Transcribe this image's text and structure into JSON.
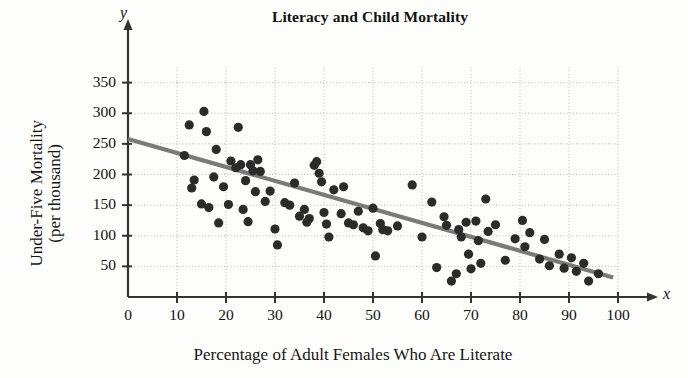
{
  "chart_data": {
    "type": "scatter",
    "title": "Literacy and Child Mortality",
    "xlabel": "Percentage of Adult Females Who Are Literate",
    "ylabel_line1": "Under-Five Mortality",
    "ylabel_line2": "(per thousand)",
    "x_axis_variable": "x",
    "y_axis_variable": "y",
    "xlim": [
      0,
      103
    ],
    "ylim": [
      0,
      375
    ],
    "xticks": [
      0,
      10,
      20,
      30,
      40,
      50,
      60,
      70,
      80,
      90,
      100
    ],
    "yticks": [
      50,
      100,
      150,
      200,
      250,
      300,
      350
    ],
    "grid": true,
    "grid_style": "dotted",
    "marker_color": "#2b2b2b",
    "trendline_color": "#7a7a7a",
    "axis_color": "#333333",
    "trendline": {
      "x_start": 0,
      "y_start": 258,
      "x_end": 99,
      "y_end": 32
    },
    "points": [
      {
        "x": 11.5,
        "y": 231
      },
      {
        "x": 12.5,
        "y": 281
      },
      {
        "x": 13.0,
        "y": 178
      },
      {
        "x": 13.5,
        "y": 191
      },
      {
        "x": 15.0,
        "y": 152
      },
      {
        "x": 15.5,
        "y": 303
      },
      {
        "x": 16.0,
        "y": 270
      },
      {
        "x": 16.5,
        "y": 146
      },
      {
        "x": 17.5,
        "y": 196
      },
      {
        "x": 18.0,
        "y": 241
      },
      {
        "x": 18.5,
        "y": 121
      },
      {
        "x": 19.5,
        "y": 180
      },
      {
        "x": 20.5,
        "y": 151
      },
      {
        "x": 21.0,
        "y": 222
      },
      {
        "x": 22.0,
        "y": 211
      },
      {
        "x": 22.5,
        "y": 277
      },
      {
        "x": 23.0,
        "y": 216
      },
      {
        "x": 23.5,
        "y": 143
      },
      {
        "x": 24.0,
        "y": 190
      },
      {
        "x": 24.5,
        "y": 123
      },
      {
        "x": 25.0,
        "y": 216
      },
      {
        "x": 25.5,
        "y": 206
      },
      {
        "x": 26.0,
        "y": 172
      },
      {
        "x": 26.5,
        "y": 224
      },
      {
        "x": 27.0,
        "y": 205
      },
      {
        "x": 28.0,
        "y": 156
      },
      {
        "x": 29.0,
        "y": 173
      },
      {
        "x": 30.0,
        "y": 111
      },
      {
        "x": 30.5,
        "y": 85
      },
      {
        "x": 32.0,
        "y": 154
      },
      {
        "x": 33.0,
        "y": 150
      },
      {
        "x": 34.0,
        "y": 186
      },
      {
        "x": 35.0,
        "y": 132
      },
      {
        "x": 36.0,
        "y": 143
      },
      {
        "x": 36.5,
        "y": 122
      },
      {
        "x": 37.0,
        "y": 128
      },
      {
        "x": 38.0,
        "y": 215
      },
      {
        "x": 38.5,
        "y": 221
      },
      {
        "x": 39.0,
        "y": 202
      },
      {
        "x": 39.5,
        "y": 188
      },
      {
        "x": 40.0,
        "y": 138
      },
      {
        "x": 40.5,
        "y": 119
      },
      {
        "x": 41.0,
        "y": 98
      },
      {
        "x": 42.0,
        "y": 175
      },
      {
        "x": 43.5,
        "y": 136
      },
      {
        "x": 44.0,
        "y": 180
      },
      {
        "x": 45.0,
        "y": 121
      },
      {
        "x": 46.0,
        "y": 118
      },
      {
        "x": 47.0,
        "y": 140
      },
      {
        "x": 48.0,
        "y": 113
      },
      {
        "x": 49.0,
        "y": 108
      },
      {
        "x": 50.0,
        "y": 145
      },
      {
        "x": 50.5,
        "y": 67
      },
      {
        "x": 51.5,
        "y": 120
      },
      {
        "x": 52.0,
        "y": 110
      },
      {
        "x": 53.0,
        "y": 108
      },
      {
        "x": 55.0,
        "y": 116
      },
      {
        "x": 58.0,
        "y": 183
      },
      {
        "x": 60.0,
        "y": 98
      },
      {
        "x": 62.0,
        "y": 155
      },
      {
        "x": 63.0,
        "y": 48
      },
      {
        "x": 64.5,
        "y": 131
      },
      {
        "x": 65.0,
        "y": 117
      },
      {
        "x": 66.0,
        "y": 26
      },
      {
        "x": 67.0,
        "y": 38
      },
      {
        "x": 67.5,
        "y": 110
      },
      {
        "x": 68.0,
        "y": 98
      },
      {
        "x": 69.0,
        "y": 122
      },
      {
        "x": 69.5,
        "y": 70
      },
      {
        "x": 70.0,
        "y": 46
      },
      {
        "x": 71.0,
        "y": 124
      },
      {
        "x": 71.5,
        "y": 92
      },
      {
        "x": 72.0,
        "y": 55
      },
      {
        "x": 73.0,
        "y": 160
      },
      {
        "x": 73.5,
        "y": 107
      },
      {
        "x": 75.0,
        "y": 118
      },
      {
        "x": 77.0,
        "y": 60
      },
      {
        "x": 79.0,
        "y": 95
      },
      {
        "x": 80.5,
        "y": 125
      },
      {
        "x": 81.0,
        "y": 82
      },
      {
        "x": 82.0,
        "y": 105
      },
      {
        "x": 84.0,
        "y": 62
      },
      {
        "x": 85.0,
        "y": 94
      },
      {
        "x": 86.0,
        "y": 51
      },
      {
        "x": 88.0,
        "y": 70
      },
      {
        "x": 89.0,
        "y": 47
      },
      {
        "x": 90.5,
        "y": 64
      },
      {
        "x": 91.5,
        "y": 42
      },
      {
        "x": 93.0,
        "y": 55
      },
      {
        "x": 94.0,
        "y": 26
      },
      {
        "x": 96.0,
        "y": 38
      }
    ]
  }
}
